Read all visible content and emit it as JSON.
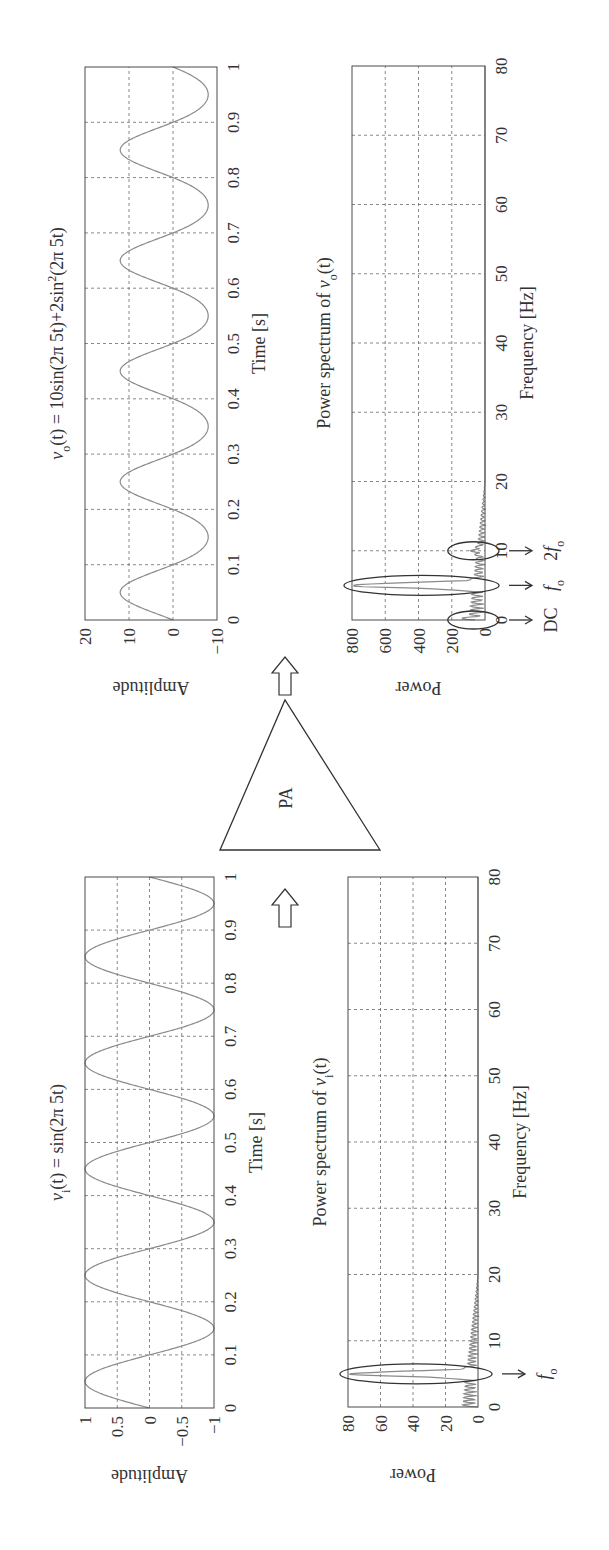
{
  "figure": {
    "orientation": "rotated-90-ccw",
    "amplifier_label": "PA",
    "colors": {
      "trace": "#8a8a8a",
      "frame": "#4a4a4a",
      "text": "#333333"
    }
  },
  "chart_data": [
    {
      "id": "vi_time",
      "type": "line",
      "title": "v_i(t) = sin(2π 5t)",
      "title_parts": {
        "var": "v",
        "sub": "i",
        "rest": "(t) = sin(2π 5t)"
      },
      "xlabel": "Time [s]",
      "ylabel": "Amplitude",
      "xlim": [
        0,
        1
      ],
      "ylim": [
        -1,
        1
      ],
      "xticks": [
        "0",
        "0.1",
        "0.2",
        "0.3",
        "0.4",
        "0.5",
        "0.6",
        "0.7",
        "0.8",
        "0.9",
        "1"
      ],
      "yticks": [
        "1",
        "0.5",
        "0",
        "−0.5",
        "−1"
      ],
      "grid": true,
      "function": "sin(2*pi*5*t)",
      "amplitude": 1,
      "frequency_hz": 5
    },
    {
      "id": "vi_power",
      "type": "line",
      "title": "Power spectrum of v_i(t)",
      "title_parts": {
        "prefix": "Power spectrum of ",
        "var": "v",
        "sub": "i",
        "rest": "(t)"
      },
      "xlabel": "Frequency [Hz]",
      "ylabel": "Power",
      "xlim": [
        0,
        80
      ],
      "ylim": [
        0,
        80
      ],
      "xticks": [
        "0",
        "10",
        "20",
        "30",
        "40",
        "50",
        "60",
        "70",
        "80"
      ],
      "yticks": [
        "80",
        "60",
        "40",
        "20",
        "0"
      ],
      "grid": true,
      "peaks": [
        {
          "freq_hz": 5,
          "power": 75,
          "annotation": "f_o"
        }
      ],
      "annotations": [
        {
          "label": "f",
          "sub": "o",
          "freq_hz": 5
        }
      ]
    },
    {
      "id": "vo_time",
      "type": "line",
      "title": "v_o(t) = 10sin(2π 5t)+2sin²(2π 5t)",
      "title_parts": {
        "var": "v",
        "sub": "o",
        "rest": "(t) = 10sin(2π 5t)+2sin",
        "sup": "2",
        "tail": "(2π 5t)"
      },
      "xlabel": "Time [s]",
      "ylabel": "Amplitude",
      "xlim": [
        0,
        1
      ],
      "ylim": [
        -10,
        20
      ],
      "xticks": [
        "0",
        "0.1",
        "0.2",
        "0.3",
        "0.4",
        "0.5",
        "0.6",
        "0.7",
        "0.8",
        "0.9",
        "1"
      ],
      "yticks": [
        "20",
        "10",
        "0",
        "−10"
      ],
      "grid": true,
      "function": "10*sin(2*pi*5*t) + 2*sin(2*pi*5*t)^2"
    },
    {
      "id": "vo_power",
      "type": "line",
      "title": "Power spectrum of v_o(t)",
      "title_parts": {
        "prefix": "Power spectrum of ",
        "var": "v",
        "sub": "o",
        "rest": "(t)"
      },
      "xlabel": "Frequency [Hz]",
      "ylabel": "Power",
      "xlim": [
        0,
        80
      ],
      "ylim": [
        0,
        800
      ],
      "xticks": [
        "0",
        "10",
        "20",
        "30",
        "40",
        "50",
        "60",
        "70",
        "80"
      ],
      "yticks": [
        "800",
        "600",
        "400",
        "200",
        "0"
      ],
      "grid": true,
      "peaks": [
        {
          "freq_hz": 0,
          "power": 60,
          "annotation": "DC"
        },
        {
          "freq_hz": 5,
          "power": 780,
          "annotation": "f_o"
        },
        {
          "freq_hz": 10,
          "power": 40,
          "annotation": "2f_o"
        }
      ],
      "annotations": [
        {
          "label": "DC",
          "freq_hz": 0
        },
        {
          "label": "f",
          "sub": "o",
          "freq_hz": 5
        },
        {
          "label": "2f",
          "sub": "o",
          "freq_hz": 10
        }
      ]
    }
  ]
}
